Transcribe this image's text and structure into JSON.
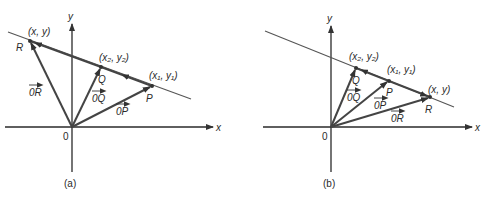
{
  "figure": {
    "panels": [
      {
        "id": "a",
        "caption": "(a)",
        "axes": {
          "x_label": "x",
          "y_label": "y",
          "origin_label": "0"
        },
        "points": [
          {
            "name": "R",
            "coord_label": "(x, y)"
          },
          {
            "name": "Q",
            "coord_label": "(x₂, y₂)"
          },
          {
            "name": "P",
            "coord_label": "(x₁, y₁)"
          }
        ],
        "vectors": [
          {
            "label": "0R"
          },
          {
            "label": "0Q"
          },
          {
            "label": "0P"
          }
        ]
      },
      {
        "id": "b",
        "caption": "(b)",
        "axes": {
          "x_label": "x",
          "y_label": "y",
          "origin_label": "0"
        },
        "points": [
          {
            "name": "Q",
            "coord_label": "(x₂, y₂)"
          },
          {
            "name": "P",
            "coord_label": "(x₁, y₁)"
          },
          {
            "name": "R",
            "coord_label": "(x, y)"
          }
        ],
        "vectors": [
          {
            "label": "0Q"
          },
          {
            "label": "0P"
          },
          {
            "label": "0R"
          }
        ]
      }
    ]
  }
}
